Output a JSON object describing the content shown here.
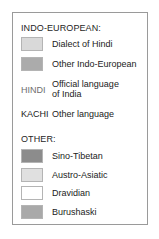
{
  "legend": {
    "sections": [
      {
        "heading": "INDO-EUROPEAN:",
        "swatch_items": [
          {
            "label": "Dialect of Hindi",
            "color": "#d9d9d9"
          },
          {
            "label": "Other Indo-European",
            "color": "#ababab"
          }
        ],
        "text_items": [
          {
            "code": "HINDI",
            "code_color": "#6e6e6e",
            "label_line1": "Official language",
            "label_line2": "of India"
          },
          {
            "code": "KACHI",
            "code_color": "#1a1a1a",
            "label_line1": "Other language"
          }
        ]
      },
      {
        "heading": "OTHER:",
        "swatch_items": [
          {
            "label": "Sino-Tibetan",
            "color": "#8c8c8c"
          },
          {
            "label": "Austro-Asiatic",
            "color": "#e0e0e0"
          },
          {
            "label": "Dravidian",
            "color": "#ffffff"
          },
          {
            "label": "Burushaski",
            "color": "#a9a9a9"
          }
        ]
      }
    ]
  }
}
